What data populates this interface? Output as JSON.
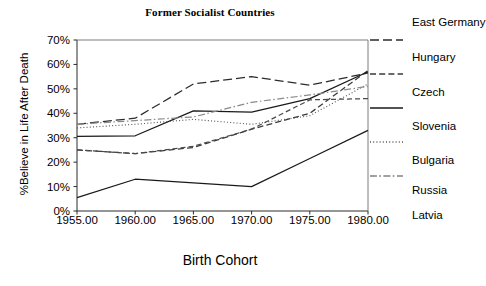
{
  "chart_data": {
    "type": "line",
    "title": "Former Socialist Countries",
    "xlabel": "Birth Cohort",
    "ylabel": "%Believe in Life After Death",
    "x": [
      1955,
      1960,
      1965,
      1970,
      1975,
      1980
    ],
    "xtick_labels": [
      "1955.00",
      "1960.00",
      "1965.00",
      "1970.00",
      "1975.00",
      "1980.00"
    ],
    "ytick_labels": [
      "0%",
      "10%",
      "20%",
      "30%",
      "40%",
      "50%",
      "60%",
      "70%"
    ],
    "ytick_values": [
      0,
      10,
      20,
      30,
      40,
      50,
      60,
      70
    ],
    "ylim": [
      0,
      70
    ],
    "xlim": [
      1955,
      1980
    ],
    "grid": false,
    "legend_position": "right",
    "series": [
      {
        "name": "East Germany",
        "dash": "long-dash",
        "color": "#2b2b2b",
        "values": [
          35.5,
          38.0,
          52.0,
          55.0,
          51.5,
          56.5
        ]
      },
      {
        "name": "Hungary",
        "dash": "dash",
        "color": "#3a3a3a",
        "values": [
          25.0,
          23.5,
          26.0,
          33.5,
          40.0,
          57.5
        ]
      },
      {
        "name": "Czech",
        "dash": "solid",
        "color": "#1a1a1a",
        "values": [
          30.5,
          30.8,
          41.0,
          40.5,
          46.0,
          57.0
        ]
      },
      {
        "name": "Slovenia",
        "dash": "dotted",
        "color": "#555555",
        "values": [
          34.0,
          35.5,
          37.5,
          35.5,
          39.0,
          52.0
        ]
      },
      {
        "name": "Bulgaria",
        "dash": "dash-dot",
        "color": "#8a8a8a",
        "values": [
          35.5,
          37.0,
          38.5,
          44.5,
          47.5,
          51.0
        ]
      },
      {
        "name": "Russia",
        "dash": "medium-dash",
        "color": "#4a4a4a",
        "values": [
          25.0,
          23.5,
          26.5,
          33.5,
          45.5,
          46.0
        ]
      },
      {
        "name": "Latvia",
        "dash": "solid",
        "color": "#1a1a1a",
        "values": [
          5.5,
          13.0,
          11.5,
          10.0,
          21.5,
          33.0
        ]
      }
    ]
  },
  "legend": {
    "items": [
      {
        "label": "East Germany",
        "swatch_dash": "long-dash"
      },
      {
        "label": "Hungary",
        "swatch_dash": "dash"
      },
      {
        "label": "Czech",
        "swatch_dash": "solid"
      },
      {
        "label": "Slovenia",
        "swatch_dash": "dotted"
      },
      {
        "label": "Bulgaria",
        "swatch_dash": "dash-dot"
      },
      {
        "label": "Russia",
        "swatch_dash": "none"
      },
      {
        "label": "Latvia",
        "swatch_dash": "none"
      }
    ]
  }
}
